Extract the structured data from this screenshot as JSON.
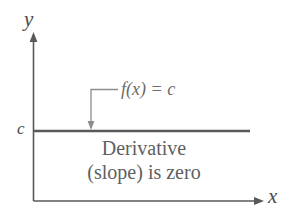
{
  "figure": {
    "background_color": "#ffffff",
    "axes": {
      "y_label": "y",
      "x_label": "x",
      "origin_label": "",
      "line_color": "#595959"
    },
    "value_label": "c",
    "function_label": {
      "function_name": "f(x)",
      "equals": "=",
      "constant": "c",
      "full_text": "f(x) = c",
      "color": "#6b6b6b"
    },
    "annotation": {
      "line1": "Derivative",
      "line2": "(slope) is zero",
      "color": "#5f5f5f"
    },
    "curve": {
      "description": "horizontal-constant-line",
      "color": "#595959",
      "y_value": "c"
    }
  }
}
